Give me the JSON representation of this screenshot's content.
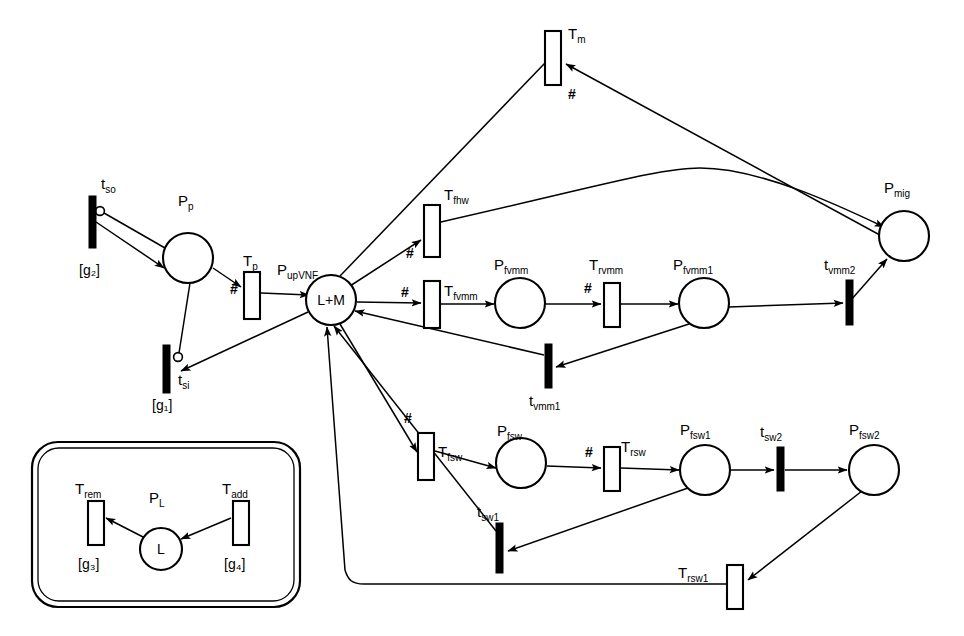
{
  "diagram": {
    "type": "petri-net"
  },
  "places": [
    {
      "id": "Pp",
      "label_main": "P",
      "label_sub": "p",
      "inner": "",
      "cx": 188,
      "cy": 258,
      "r": 25
    },
    {
      "id": "PupVNF",
      "label_main": "P",
      "label_sub": "upVNF",
      "inner": "L+M",
      "cx": 331,
      "cy": 300,
      "r": 25
    },
    {
      "id": "Pfvmm",
      "label_main": "P",
      "label_sub": "fvmm",
      "inner": "",
      "cx": 520,
      "cy": 303,
      "r": 25
    },
    {
      "id": "Pfvmm1",
      "label_main": "P",
      "label_sub": "fvmm1",
      "inner": "",
      "cx": 704,
      "cy": 303,
      "r": 25
    },
    {
      "id": "Pmig",
      "label_main": "P",
      "label_sub": "mig",
      "inner": "",
      "cx": 904,
      "cy": 236,
      "r": 25
    },
    {
      "id": "Pfsw",
      "label_main": "P",
      "label_sub": "fsw",
      "inner": "",
      "cx": 521,
      "cy": 463,
      "r": 25
    },
    {
      "id": "Pfsw1",
      "label_main": "P",
      "label_sub": "fsw1",
      "inner": "",
      "cx": 705,
      "cy": 470,
      "r": 25
    },
    {
      "id": "Pfsw2",
      "label_main": "P",
      "label_sub": "fsw2",
      "inner": "",
      "cx": 874,
      "cy": 470,
      "r": 25
    },
    {
      "id": "PL",
      "label_main": "P",
      "label_sub": "L",
      "inner": "L",
      "cx": 161,
      "cy": 549,
      "r": 21
    }
  ],
  "transitions": [
    {
      "id": "tso",
      "label_main": "t",
      "label_sub": "so",
      "kind": "solid",
      "guard": "[g₂]",
      "x": 89,
      "y": 196,
      "w": 7,
      "h": 52
    },
    {
      "id": "tsi",
      "label_main": "t",
      "label_sub": "si",
      "kind": "solid",
      "guard": "[g₁]",
      "x": 163,
      "y": 345,
      "w": 7,
      "h": 48
    },
    {
      "id": "Tp",
      "label_main": "T",
      "label_sub": "p",
      "kind": "open",
      "guard": "",
      "x": 244,
      "y": 272,
      "w": 16,
      "h": 47
    },
    {
      "id": "Tm",
      "label_main": "T",
      "label_sub": "m",
      "kind": "open",
      "guard": "",
      "x": 545,
      "y": 31,
      "w": 16,
      "h": 54
    },
    {
      "id": "Tfhw",
      "label_main": "T",
      "label_sub": "fhw",
      "kind": "open",
      "guard": "",
      "x": 424,
      "y": 205,
      "w": 16,
      "h": 52
    },
    {
      "id": "Tfvmm",
      "label_main": "T",
      "label_sub": "fvmm",
      "kind": "open",
      "guard": "",
      "x": 424,
      "y": 281,
      "w": 16,
      "h": 47
    },
    {
      "id": "Trvmm",
      "label_main": "T",
      "label_sub": "rvmm",
      "kind": "open",
      "guard": "",
      "x": 604,
      "y": 283,
      "w": 16,
      "h": 44
    },
    {
      "id": "tvmm2",
      "label_main": "t",
      "label_sub": "vmm2",
      "kind": "solid",
      "guard": "",
      "x": 846,
      "y": 280,
      "w": 7,
      "h": 45
    },
    {
      "id": "tvmm1",
      "label_main": "t",
      "label_sub": "vmm1",
      "kind": "solid",
      "guard": "",
      "x": 545,
      "y": 344,
      "w": 7,
      "h": 44
    },
    {
      "id": "Tfsw",
      "label_main": "T",
      "label_sub": "fsw",
      "kind": "open",
      "guard": "",
      "x": 418,
      "y": 433,
      "w": 16,
      "h": 47
    },
    {
      "id": "Trsw",
      "label_main": "T",
      "label_sub": "rsw",
      "kind": "open",
      "guard": "",
      "x": 604,
      "y": 447,
      "w": 16,
      "h": 44
    },
    {
      "id": "tsw2",
      "label_main": "t",
      "label_sub": "sw2",
      "kind": "solid",
      "guard": "",
      "x": 777,
      "y": 447,
      "w": 7,
      "h": 44
    },
    {
      "id": "tsw1",
      "label_main": "t",
      "label_sub": "sw1",
      "kind": "solid",
      "guard": "",
      "x": 496,
      "y": 523,
      "w": 7,
      "h": 50
    },
    {
      "id": "Trsw1",
      "label_main": "T",
      "label_sub": "rsw1",
      "kind": "open",
      "guard": "",
      "x": 727,
      "y": 565,
      "w": 16,
      "h": 44
    },
    {
      "id": "Trem",
      "label_main": "T",
      "label_sub": "rem",
      "kind": "open",
      "guard": "[g₃]",
      "x": 88,
      "y": 501,
      "w": 16,
      "h": 44
    },
    {
      "id": "Tadd",
      "label_main": "T",
      "label_sub": "add",
      "kind": "open",
      "guard": "[g₄]",
      "x": 233,
      "y": 501,
      "w": 16,
      "h": 44
    }
  ],
  "hash_labels": [
    {
      "id": "h-Tm",
      "text": "#",
      "x": 568,
      "y": 99
    },
    {
      "id": "h-Tfhw",
      "text": "#",
      "x": 406,
      "y": 258
    },
    {
      "id": "h-Tfvmm",
      "text": "#",
      "x": 401,
      "y": 297
    },
    {
      "id": "h-Trvmm",
      "text": "#",
      "x": 584,
      "y": 293
    },
    {
      "id": "h-Tp",
      "text": "#",
      "x": 230,
      "y": 294
    },
    {
      "id": "h-Tfsw",
      "text": "#",
      "x": 404,
      "y": 423
    },
    {
      "id": "h-Trsw",
      "text": "#",
      "x": 585,
      "y": 457
    }
  ],
  "legend_box": {
    "name": "legend-subnet-box",
    "x": 32,
    "y": 442,
    "w": 268,
    "h": 165
  },
  "colors": {
    "stroke": "#000000",
    "fill": "#ffffff",
    "solid_transition": "#000000"
  },
  "arcs": [
    {
      "id": "tso-Pp",
      "from": "tso",
      "to": "Pp",
      "kind": "normal"
    },
    {
      "id": "Pp-tso-inhib",
      "from": "Pp",
      "to": "tso",
      "kind": "inhibitor"
    },
    {
      "id": "Pp-Tp",
      "from": "Pp",
      "to": "Tp",
      "kind": "normal"
    },
    {
      "id": "Pp-tsi-inhib",
      "from": "Pp",
      "to": "tsi",
      "kind": "inhibitor"
    },
    {
      "id": "Tp-PupVNF",
      "from": "Tp",
      "to": "PupVNF",
      "kind": "normal"
    },
    {
      "id": "PupVNF-tsi",
      "from": "PupVNF",
      "to": "tsi",
      "kind": "normal"
    },
    {
      "id": "PupVNF-Tm",
      "from": "PupVNF",
      "to": "Tm",
      "kind": "normal"
    },
    {
      "id": "Tm-Pmig",
      "from": "Tm",
      "to": "Pmig",
      "kind": "normal"
    },
    {
      "id": "PupVNF-Tfhw",
      "from": "PupVNF",
      "to": "Tfhw",
      "kind": "normal"
    },
    {
      "id": "Tfhw-Pmig",
      "from": "Tfhw",
      "to": "Pmig",
      "kind": "normal"
    },
    {
      "id": "PupVNF-Tfvmm",
      "from": "PupVNF",
      "to": "Tfvmm",
      "kind": "normal"
    },
    {
      "id": "Tfvmm-Pfvmm",
      "from": "Tfvmm",
      "to": "Pfvmm",
      "kind": "normal"
    },
    {
      "id": "Pfvmm-Trvmm",
      "from": "Pfvmm",
      "to": "Trvmm",
      "kind": "normal"
    },
    {
      "id": "Trvmm-Pfvmm1",
      "from": "Trvmm",
      "to": "Pfvmm1",
      "kind": "normal"
    },
    {
      "id": "Pfvmm1-tvmm2",
      "from": "Pfvmm1",
      "to": "tvmm2",
      "kind": "normal"
    },
    {
      "id": "tvmm2-Pmig",
      "from": "tvmm2",
      "to": "Pmig",
      "kind": "normal"
    },
    {
      "id": "Pfvmm1-tvmm1",
      "from": "Pfvmm1",
      "to": "tvmm1",
      "kind": "normal"
    },
    {
      "id": "tvmm1-PupVNF",
      "from": "tvmm1",
      "to": "PupVNF",
      "kind": "normal"
    },
    {
      "id": "PupVNF-Tfsw",
      "from": "PupVNF",
      "to": "Tfsw",
      "kind": "normal"
    },
    {
      "id": "Tfsw-Pfsw",
      "from": "Tfsw",
      "to": "Pfsw",
      "kind": "normal"
    },
    {
      "id": "Pfsw-Trsw",
      "from": "Pfsw",
      "to": "Trsw",
      "kind": "normal"
    },
    {
      "id": "Trsw-Pfsw1",
      "from": "Trsw",
      "to": "Pfsw1",
      "kind": "normal"
    },
    {
      "id": "Pfsw1-tsw2",
      "from": "Pfsw1",
      "to": "tsw2",
      "kind": "normal"
    },
    {
      "id": "tsw2-Pfsw2",
      "from": "tsw2",
      "to": "Pfsw2",
      "kind": "normal"
    },
    {
      "id": "Pfsw1-tsw1",
      "from": "Pfsw1",
      "to": "tsw1",
      "kind": "normal"
    },
    {
      "id": "tsw1-PupVNF",
      "from": "tsw1",
      "to": "PupVNF",
      "kind": "normal"
    },
    {
      "id": "Pfsw2-Trsw1",
      "from": "Pfsw2",
      "to": "Trsw1",
      "kind": "normal"
    },
    {
      "id": "Trsw1-PupVNF",
      "from": "Trsw1",
      "to": "PupVNF",
      "kind": "normal"
    },
    {
      "id": "PL-Trem",
      "from": "PL",
      "to": "Trem",
      "kind": "normal"
    },
    {
      "id": "Tadd-PL",
      "from": "Tadd",
      "to": "PL",
      "kind": "normal"
    }
  ]
}
